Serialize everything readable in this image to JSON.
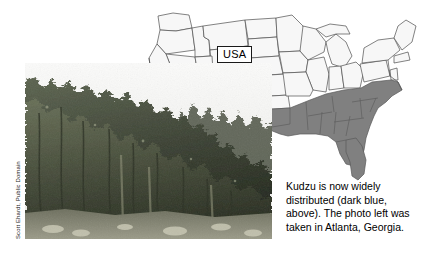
{
  "figure": {
    "background_color": "#ffffff"
  },
  "map": {
    "label": "USA",
    "label_name": "usa-map-label",
    "outline_color": "#4d4d4d",
    "state_fill": "#f7f7f7",
    "highlight_fill": "#808080",
    "highlight_legend_text": "dark blue",
    "highlighted_region": "Southeastern United States",
    "highlighted_states": [
      "Texas (east)",
      "Oklahoma (southeast)",
      "Arkansas",
      "Louisiana",
      "Mississippi",
      "Alabama",
      "Georgia",
      "Florida",
      "South Carolina",
      "North Carolina",
      "Tennessee",
      "Kentucky",
      "Virginia",
      "West Virginia",
      "Maryland",
      "Delaware",
      "Missouri (south)",
      "Illinois (south)",
      "Indiana (south)",
      "Ohio (south)"
    ]
  },
  "photo": {
    "alt": "Hillside completely covered by kudzu vines",
    "subject": "kudzu-covered-vegetation",
    "location": "Atlanta, Georgia",
    "credit": "Scott Ehardt, Public Domain"
  },
  "caption": {
    "lines": [
      "Kudzu is now widely",
      "distributed (dark blue,",
      "above). The photo left was",
      "taken in Atlanta, Georgia."
    ],
    "full_text": "Kudzu is now widely distributed (dark blue, above). The photo left was taken in Atlanta, Georgia."
  }
}
